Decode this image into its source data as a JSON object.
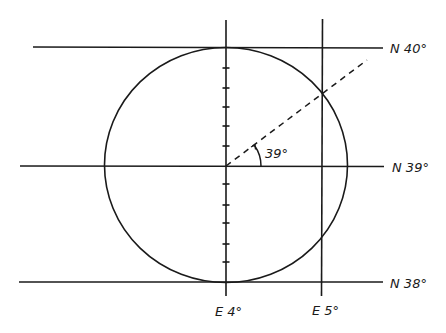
{
  "diagram": {
    "colors": {
      "stroke": "#1a1a1a",
      "background": "#ffffff"
    },
    "latitude_labels": {
      "n40": "N 40°",
      "n39": "N 39°",
      "n38": "N 38°"
    },
    "longitude_labels": {
      "e4": "E 4°",
      "e5": "E 5°"
    },
    "angle_label": "39°",
    "tick_count_upper": 5,
    "tick_count_lower": 5
  }
}
